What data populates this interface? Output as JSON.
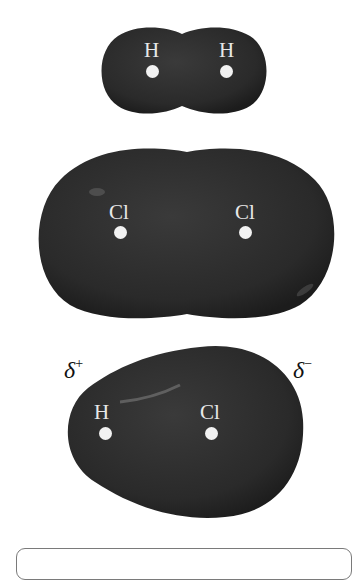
{
  "molecules": [
    {
      "name": "H2",
      "atoms": [
        {
          "label": "H"
        },
        {
          "label": "H"
        }
      ]
    },
    {
      "name": "Cl2",
      "atoms": [
        {
          "label": "Cl"
        },
        {
          "label": "Cl"
        }
      ]
    },
    {
      "name": "HCl",
      "atoms": [
        {
          "label": "H"
        },
        {
          "label": "Cl"
        }
      ],
      "partial_charges": {
        "left": {
          "symbol": "δ",
          "sign": "+"
        },
        "right": {
          "symbol": "δ",
          "sign": "−"
        }
      }
    }
  ],
  "colors": {
    "surface": "#2c2c2c",
    "highlight": "#6a6a6a",
    "atom_label": "#e8e8e8",
    "nucleus": "#f2f2f2"
  }
}
